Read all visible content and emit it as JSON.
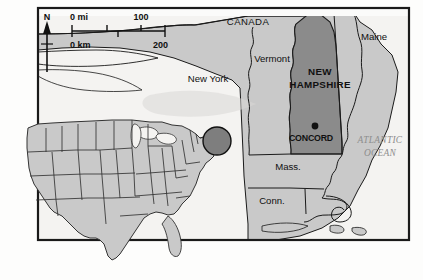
{
  "map": {
    "title": "New Hampshire locator map",
    "frame": {
      "border_color": "#1a1a1a"
    },
    "colors": {
      "land": "#c9c9c9",
      "highlight": "#8b8b8b",
      "water": "#f2f2f0",
      "border": "#1a1a1a",
      "ocean_label": "#8e8e8e",
      "inset_marker": "#7e7e7e"
    },
    "compass": {
      "label": "N",
      "icon": "north-arrow-icon"
    },
    "scale_bar": {
      "miles_unit_label": "0 mi",
      "miles_max_label": "100",
      "km_unit_label": "0 km",
      "km_max_label": "200"
    },
    "labels": {
      "canada": "CANADA",
      "new_york": "New York",
      "vermont": "Vermont",
      "maine": "Maine",
      "new_hampshire_line1": "NEW",
      "new_hampshire_line2": "HAMPSHIRE",
      "massachusetts": "Mass.",
      "connecticut": "Conn.",
      "atlantic_line1": "ATLANTIC",
      "atlantic_line2": "OCEAN",
      "capital": "CONCORD"
    },
    "inset": {
      "name": "united-states-inset",
      "marker_label": "New England region marker"
    }
  }
}
